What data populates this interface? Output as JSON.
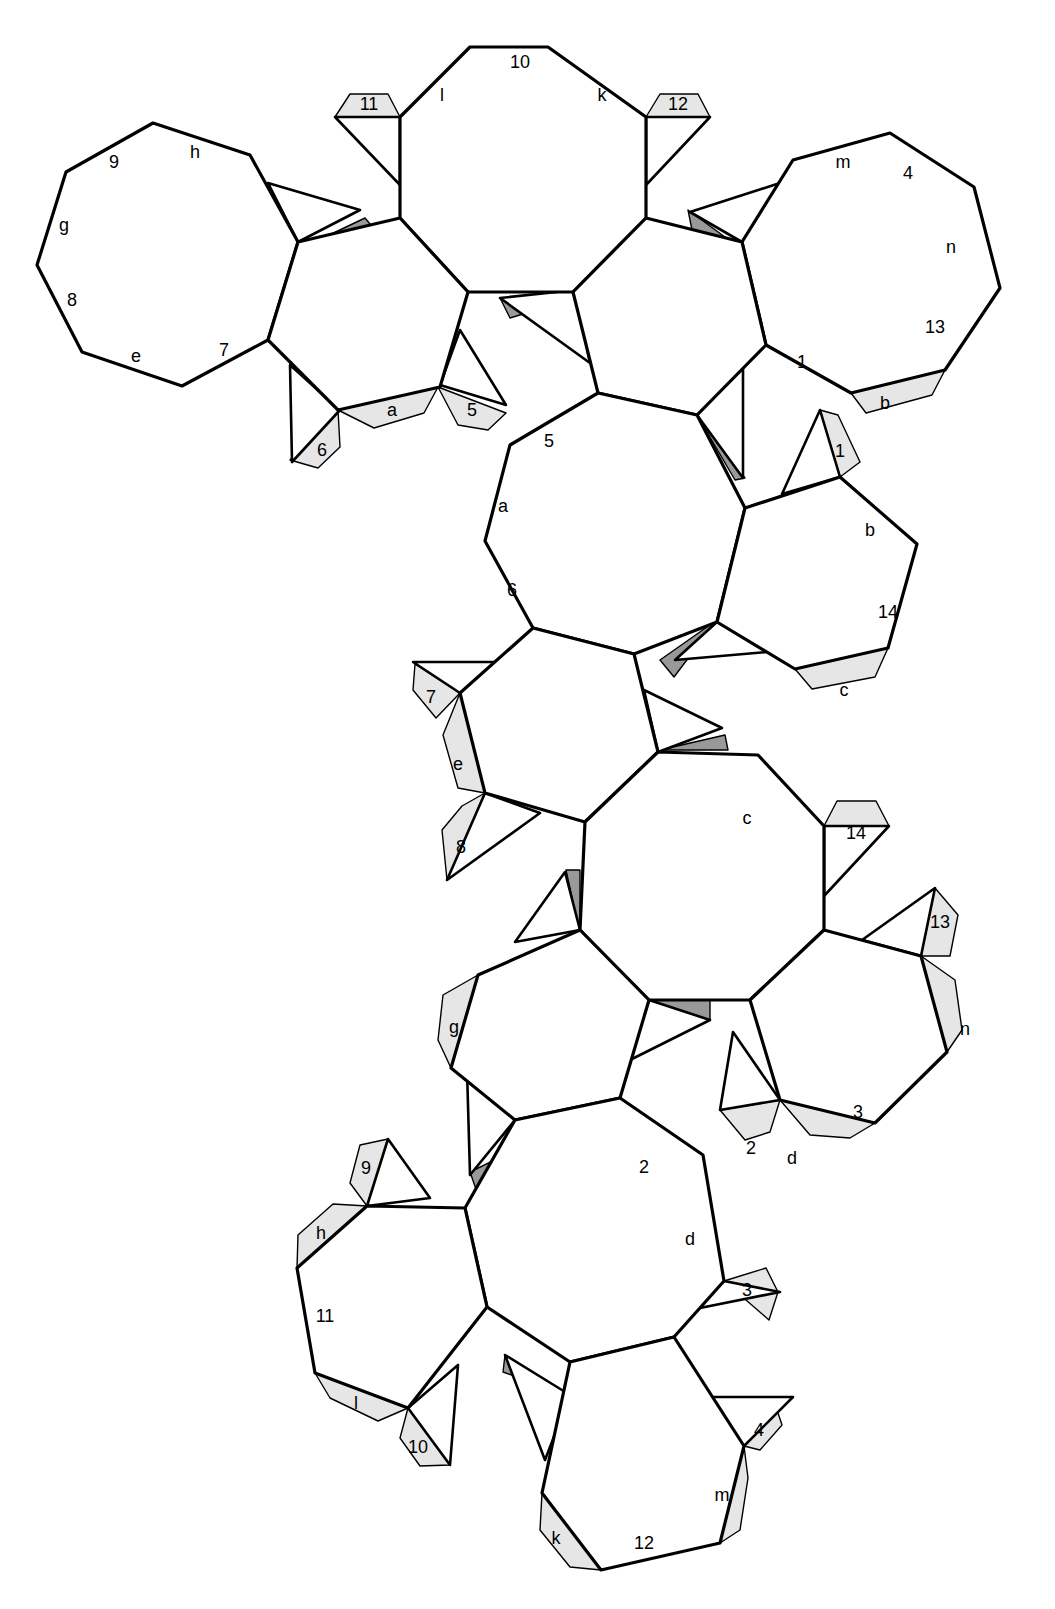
{
  "diagram": {
    "type": "polyhedron-net",
    "colors": {
      "line": "#000000",
      "face": "#ffffff",
      "glue_tab": "#e6e6e6",
      "shaded_flap": "#999999"
    },
    "faces": [
      {
        "id": "A",
        "shape": "octagon",
        "position": "top-left",
        "edge_labels": [
          "9",
          "h",
          "g",
          "8",
          "e",
          "7"
        ]
      },
      {
        "id": "B",
        "shape": "octagon",
        "position": "top-center",
        "edge_labels": [
          "10",
          "l",
          "k"
        ]
      },
      {
        "id": "C",
        "shape": "octagon",
        "position": "top-right",
        "edge_labels": [
          "m",
          "4",
          "n",
          "13",
          "1"
        ]
      },
      {
        "id": "D",
        "shape": "octagon",
        "position": "center",
        "edge_labels": [
          "5",
          "a",
          "6"
        ]
      },
      {
        "id": "E",
        "shape": "hexagon",
        "position": "center-right",
        "edge_labels": [
          "b",
          "14"
        ]
      },
      {
        "id": "F",
        "shape": "octagon",
        "position": "middle",
        "edge_labels": [
          "c"
        ]
      },
      {
        "id": "G",
        "shape": "octagon",
        "position": "lower-right",
        "edge_labels": [
          "3"
        ]
      },
      {
        "id": "H",
        "shape": "octagon",
        "position": "lower-center",
        "edge_labels": [
          "2",
          "d"
        ]
      },
      {
        "id": "I",
        "shape": "hexagon",
        "position": "bottom-left",
        "edge_labels": [
          "11"
        ]
      },
      {
        "id": "J",
        "shape": "hexagon",
        "position": "bottom",
        "edge_labels": [
          "12"
        ]
      }
    ],
    "glue_tabs": [
      "11",
      "12",
      "a",
      "5",
      "6",
      "b",
      "1",
      "7",
      "e",
      "8",
      "c",
      "14",
      "13",
      "n",
      "g",
      "2",
      "d",
      "9",
      "h",
      "3",
      "l",
      "10",
      "4",
      "k",
      "m"
    ],
    "labels": [
      {
        "t": "10",
        "x": 520,
        "y": 62
      },
      {
        "t": "l",
        "x": 442,
        "y": 95
      },
      {
        "t": "k",
        "x": 602,
        "y": 95
      },
      {
        "t": "11",
        "x": 369,
        "y": 104
      },
      {
        "t": "12",
        "x": 678,
        "y": 104
      },
      {
        "t": "9",
        "x": 114,
        "y": 162
      },
      {
        "t": "h",
        "x": 195,
        "y": 152
      },
      {
        "t": "g",
        "x": 64,
        "y": 225
      },
      {
        "t": "8",
        "x": 72,
        "y": 300
      },
      {
        "t": "e",
        "x": 136,
        "y": 356
      },
      {
        "t": "7",
        "x": 224,
        "y": 350
      },
      {
        "t": "m",
        "x": 843,
        "y": 162
      },
      {
        "t": "4",
        "x": 908,
        "y": 173
      },
      {
        "t": "n",
        "x": 951,
        "y": 247
      },
      {
        "t": "13",
        "x": 935,
        "y": 327
      },
      {
        "t": "1",
        "x": 802,
        "y": 362
      },
      {
        "t": "b",
        "x": 885,
        "y": 403
      },
      {
        "t": "a",
        "x": 392,
        "y": 410
      },
      {
        "t": "5",
        "x": 472,
        "y": 410
      },
      {
        "t": "6",
        "x": 322,
        "y": 450
      },
      {
        "t": "5",
        "x": 549,
        "y": 441
      },
      {
        "t": "a",
        "x": 503,
        "y": 506
      },
      {
        "t": "6",
        "x": 512,
        "y": 590
      },
      {
        "t": "1",
        "x": 840,
        "y": 451
      },
      {
        "t": "b",
        "x": 870,
        "y": 530
      },
      {
        "t": "14",
        "x": 888,
        "y": 612
      },
      {
        "t": "c",
        "x": 844,
        "y": 690
      },
      {
        "t": "7",
        "x": 431,
        "y": 697
      },
      {
        "t": "e",
        "x": 458,
        "y": 764
      },
      {
        "t": "8",
        "x": 461,
        "y": 847
      },
      {
        "t": "c",
        "x": 747,
        "y": 818
      },
      {
        "t": "14",
        "x": 856,
        "y": 833
      },
      {
        "t": "13",
        "x": 940,
        "y": 922
      },
      {
        "t": "g",
        "x": 454,
        "y": 1027
      },
      {
        "t": "n",
        "x": 965,
        "y": 1029
      },
      {
        "t": "3",
        "x": 858,
        "y": 1112
      },
      {
        "t": "2",
        "x": 751,
        "y": 1148
      },
      {
        "t": "d",
        "x": 792,
        "y": 1158
      },
      {
        "t": "2",
        "x": 644,
        "y": 1167
      },
      {
        "t": "9",
        "x": 366,
        "y": 1168
      },
      {
        "t": "h",
        "x": 321,
        "y": 1233
      },
      {
        "t": "d",
        "x": 690,
        "y": 1239
      },
      {
        "t": "3",
        "x": 747,
        "y": 1290
      },
      {
        "t": "11",
        "x": 325,
        "y": 1316
      },
      {
        "t": "l",
        "x": 356,
        "y": 1403
      },
      {
        "t": "10",
        "x": 418,
        "y": 1447
      },
      {
        "t": "4",
        "x": 759,
        "y": 1430
      },
      {
        "t": "m",
        "x": 722,
        "y": 1495
      },
      {
        "t": "k",
        "x": 556,
        "y": 1538
      },
      {
        "t": "12",
        "x": 644,
        "y": 1543
      }
    ]
  }
}
